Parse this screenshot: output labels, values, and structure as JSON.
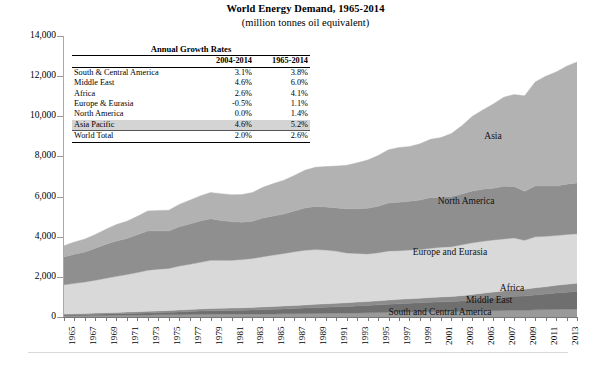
{
  "chart_data": {
    "type": "area",
    "title": "World Energy Demand, 1965-2014",
    "subtitle": "(million tonnes oil equivalent)",
    "xlabel": "",
    "ylabel": "",
    "ylim": [
      0,
      14000
    ],
    "ytick_values": [
      0,
      2000,
      4000,
      6000,
      8000,
      10000,
      12000,
      14000
    ],
    "ytick_labels": [
      "0",
      "2,000",
      "4,000",
      "6,000",
      "8,000",
      "10,000",
      "12,000",
      "14,000"
    ],
    "grid": false,
    "legend_position": "in-plot-labels",
    "stacked": true,
    "x": [
      1965,
      1966,
      1967,
      1968,
      1969,
      1970,
      1971,
      1972,
      1973,
      1974,
      1975,
      1976,
      1977,
      1978,
      1979,
      1980,
      1981,
      1982,
      1983,
      1984,
      1985,
      1986,
      1987,
      1988,
      1989,
      1990,
      1991,
      1992,
      1993,
      1994,
      1995,
      1996,
      1997,
      1998,
      1999,
      2000,
      2001,
      2002,
      2003,
      2004,
      2005,
      2006,
      2007,
      2008,
      2009,
      2010,
      2011,
      2012,
      2013,
      2014
    ],
    "xtick_labels": [
      "1965",
      "1967",
      "1969",
      "1971",
      "1973",
      "1975",
      "1977",
      "1979",
      "1981",
      "1983",
      "1985",
      "1987",
      "1989",
      "1991",
      "1993",
      "1995",
      "1997",
      "1999",
      "2001",
      "2003",
      "2005",
      "2007",
      "2009",
      "2011",
      "2013"
    ],
    "series": [
      {
        "name": "South and Central America",
        "color": "#9a9a9a",
        "values": [
          60,
          64,
          68,
          73,
          78,
          84,
          89,
          95,
          102,
          107,
          110,
          117,
          124,
          131,
          137,
          139,
          138,
          140,
          140,
          146,
          150,
          157,
          163,
          170,
          177,
          182,
          187,
          194,
          201,
          210,
          221,
          231,
          243,
          250,
          255,
          263,
          265,
          266,
          272,
          288,
          301,
          313,
          328,
          338,
          332,
          356,
          368,
          381,
          388,
          395
        ]
      },
      {
        "name": "Middle East",
        "color": "#6f6f6f",
        "values": [
          47,
          52,
          57,
          63,
          69,
          76,
          84,
          93,
          103,
          111,
          121,
          135,
          149,
          163,
          175,
          177,
          184,
          194,
          206,
          220,
          233,
          246,
          257,
          273,
          286,
          300,
          318,
          335,
          352,
          365,
          384,
          400,
          418,
          437,
          452,
          471,
          489,
          505,
          529,
          562,
          597,
          625,
          657,
          694,
          714,
          746,
          781,
          820,
          850,
          880
        ]
      },
      {
        "name": "Africa",
        "color": "#8c8c8c",
        "values": [
          48,
          51,
          54,
          58,
          62,
          67,
          71,
          76,
          82,
          86,
          90,
          96,
          102,
          108,
          113,
          118,
          122,
          127,
          131,
          137,
          143,
          149,
          154,
          161,
          167,
          173,
          178,
          183,
          189,
          195,
          202,
          210,
          218,
          224,
          230,
          238,
          245,
          253,
          263,
          277,
          291,
          302,
          316,
          330,
          336,
          352,
          360,
          377,
          391,
          403
        ]
      },
      {
        "name": "Europe and Eurasia",
        "color": "#d9d9d9",
        "values": [
          1450,
          1510,
          1565,
          1640,
          1720,
          1800,
          1870,
          1950,
          2040,
          2080,
          2100,
          2190,
          2250,
          2320,
          2400,
          2390,
          2380,
          2400,
          2440,
          2500,
          2560,
          2610,
          2680,
          2720,
          2730,
          2680,
          2600,
          2480,
          2420,
          2370,
          2390,
          2450,
          2420,
          2430,
          2420,
          2450,
          2480,
          2480,
          2540,
          2570,
          2580,
          2600,
          2590,
          2580,
          2440,
          2540,
          2510,
          2480,
          2480,
          2470
        ]
      },
      {
        "name": "North America",
        "color": "#8f8f8f",
        "values": [
          1390,
          1450,
          1500,
          1590,
          1690,
          1760,
          1800,
          1890,
          1960,
          1910,
          1860,
          1960,
          2010,
          2060,
          2070,
          1990,
          1930,
          1860,
          1850,
          1930,
          1950,
          1970,
          2030,
          2110,
          2150,
          2150,
          2150,
          2200,
          2230,
          2280,
          2320,
          2390,
          2420,
          2430,
          2470,
          2530,
          2470,
          2500,
          2520,
          2580,
          2600,
          2580,
          2620,
          2560,
          2440,
          2530,
          2510,
          2470,
          2510,
          2530
        ]
      },
      {
        "name": "Asia",
        "color": "#b2b2b2",
        "values": [
          560,
          610,
          640,
          690,
          750,
          820,
          860,
          910,
          1000,
          1010,
          1040,
          1110,
          1180,
          1250,
          1310,
          1330,
          1340,
          1380,
          1440,
          1530,
          1610,
          1680,
          1770,
          1880,
          1950,
          2010,
          2090,
          2170,
          2290,
          2400,
          2530,
          2650,
          2730,
          2720,
          2800,
          2900,
          2990,
          3140,
          3410,
          3720,
          3950,
          4190,
          4440,
          4580,
          4760,
          5180,
          5470,
          5680,
          5880,
          6030
        ]
      }
    ]
  },
  "growth_table": {
    "heading": "Annual Growth Rates",
    "columns": [
      "",
      "2004-2014",
      "1965-2014"
    ],
    "rows": [
      {
        "label": "South & Central America",
        "c1": "3.1%",
        "c2": "3.8%",
        "highlight": false,
        "last": false
      },
      {
        "label": "Middle East",
        "c1": "4.6%",
        "c2": "6.0%",
        "highlight": false,
        "last": false
      },
      {
        "label": "Africa",
        "c1": "2.6%",
        "c2": "4.1%",
        "highlight": false,
        "last": false
      },
      {
        "label": "Europe & Eurasia",
        "c1": "-0.5%",
        "c2": "1.1%",
        "highlight": false,
        "last": false
      },
      {
        "label": "North America",
        "c1": "0.0%",
        "c2": "1.4%",
        "highlight": false,
        "last": false
      },
      {
        "label": "Asia Pacific",
        "c1": "4.6%",
        "c2": "5.2%",
        "highlight": true,
        "last": false
      },
      {
        "label": "World Total",
        "c1": "2.0%",
        "c2": "2.6%",
        "highlight": false,
        "last": true
      }
    ]
  },
  "plot_labels": [
    {
      "text": "Asia",
      "x": 493,
      "y": 131
    },
    {
      "text": "North America",
      "x": 466,
      "y": 196
    },
    {
      "text": "Europe and Eurasia",
      "x": 450,
      "y": 247
    },
    {
      "text": "Africa",
      "x": 512,
      "y": 283
    },
    {
      "text": "Middle East",
      "x": 489,
      "y": 295
    },
    {
      "text": "South and Central America",
      "x": 440,
      "y": 307
    }
  ]
}
